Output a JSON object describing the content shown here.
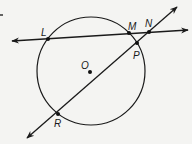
{
  "diagram": {
    "title": "",
    "background": "#f4f4f2",
    "stroke_color": "#1a1a1a",
    "circle": {
      "center_label": "O",
      "cx": 91,
      "cy": 71,
      "r": 54
    },
    "points": [
      {
        "id": "L",
        "label": "L",
        "x": 48,
        "y": 39,
        "lx": 41,
        "ly": 36
      },
      {
        "id": "M",
        "label": "M",
        "x": 129,
        "y": 33,
        "lx": 128,
        "ly": 30
      },
      {
        "id": "N",
        "label": "N",
        "x": 149,
        "y": 32,
        "lx": 145,
        "ly": 27
      },
      {
        "id": "P",
        "label": "P",
        "x": 137,
        "y": 43,
        "lx": 133,
        "ly": 59
      },
      {
        "id": "R",
        "label": "R",
        "x": 58,
        "y": 114,
        "lx": 54,
        "ly": 127
      },
      {
        "id": "O",
        "label": "O",
        "x": 90,
        "y": 72,
        "lx": 81,
        "ly": 69
      }
    ],
    "lines": [
      {
        "id": "line-LN",
        "through": [
          "L",
          "M",
          "N"
        ],
        "x1": 12,
        "y1": 41,
        "x2": 188,
        "y2": 30,
        "arrows": "both"
      },
      {
        "id": "line-RP",
        "through": [
          "R",
          "P",
          "N"
        ],
        "x1": 27,
        "y1": 138,
        "x2": 177,
        "y2": 7,
        "arrows": "both"
      }
    ]
  }
}
